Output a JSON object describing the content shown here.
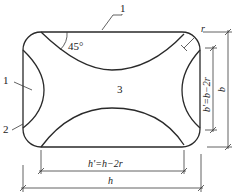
{
  "diagram": {
    "type": "engineering-cross-section",
    "labels": {
      "part_1_top": "1",
      "part_1_left": "1",
      "part_2": "2",
      "part_3": "3",
      "angle": "45°",
      "radius": "r"
    },
    "dimensions": {
      "b": "b",
      "b_prime": "b'=b−2r",
      "h_prime": "h'=h−2r",
      "h": "h"
    },
    "colors": {
      "line": "#2a2a2a",
      "background": "#ffffff"
    }
  }
}
